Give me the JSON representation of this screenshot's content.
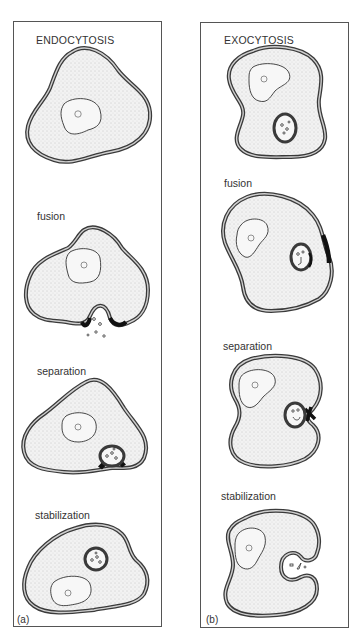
{
  "figure": {
    "panels": [
      {
        "id": "a",
        "title": "ENDOCYTOSIS",
        "label": "(a)",
        "stages": [
          "",
          "fusion",
          "separation",
          "stabilization"
        ]
      },
      {
        "id": "b",
        "title": "EXOCYTOSIS",
        "label": "(b)",
        "stages": [
          "",
          "fusion",
          "separation",
          "stabilization"
        ]
      }
    ],
    "colors": {
      "membrane": "#3a3a3a",
      "membrane_fill": "#bdbdbd",
      "cytoplasm": "#ececec",
      "stipple": "#9a9a9a",
      "fusion_zone": "#111111",
      "border": "#555555"
    }
  }
}
